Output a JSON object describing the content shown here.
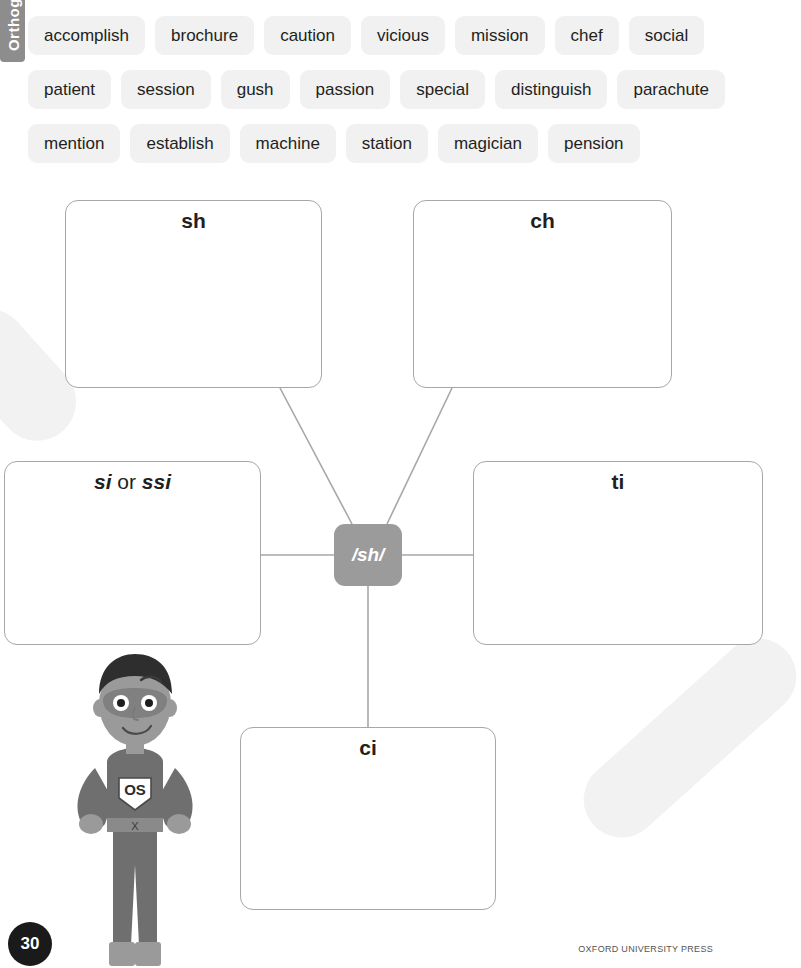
{
  "side_tab": {
    "label": "Orthogra"
  },
  "word_bank": {
    "rows": [
      [
        "accomplish",
        "brochure",
        "caution",
        "vicious",
        "mission",
        "chef",
        "social"
      ],
      [
        "patient",
        "session",
        "gush",
        "passion",
        "special",
        "distinguish",
        "parachute"
      ],
      [
        "mention",
        "establish",
        "machine",
        "station",
        "magician",
        "pension"
      ]
    ]
  },
  "diagram": {
    "hub": {
      "label": "/sh/"
    },
    "nodes": {
      "sh": {
        "label": "sh"
      },
      "ch": {
        "label": "ch"
      },
      "si": {
        "label_part1": "si",
        "label_conjunction": " or ",
        "label_part2": "ssi"
      },
      "ti": {
        "label": "ti"
      },
      "ci": {
        "label": "ci"
      }
    }
  },
  "mascot": {
    "emblem": "OS",
    "belt_mark": "X"
  },
  "footer": {
    "page_number": "30",
    "publisher": "OXFORD UNIVERSITY PRESS"
  },
  "colors": {
    "chip_bg": "#f1f1f1",
    "hub_bg": "#9b9b9b",
    "box_border": "#a7a7a7",
    "tab_bg": "#8d8d8d",
    "page_badge_bg": "#1a1a1a"
  }
}
